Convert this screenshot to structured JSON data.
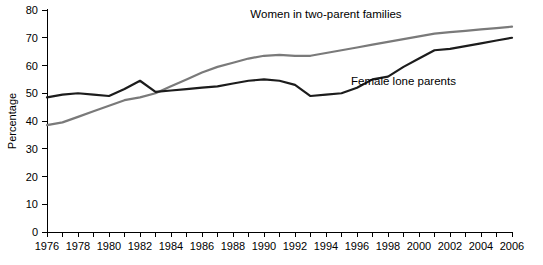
{
  "chart_data": {
    "type": "line",
    "title": "",
    "xlabel": "",
    "ylabel": "Percentage",
    "xlim": [
      1976,
      2006
    ],
    "ylim": [
      0,
      80
    ],
    "grid": false,
    "legend_position": "inline-annotation",
    "y_ticks": [
      0,
      10,
      20,
      30,
      40,
      50,
      60,
      70,
      80
    ],
    "y_tick_labels": [
      "0",
      "10",
      "20",
      "30",
      "40",
      "50",
      "60",
      "70",
      "80"
    ],
    "x_ticks": [
      1976,
      1977,
      1978,
      1979,
      1980,
      1981,
      1982,
      1983,
      1984,
      1985,
      1986,
      1987,
      1988,
      1989,
      1990,
      1991,
      1992,
      1993,
      1994,
      1995,
      1996,
      1997,
      1998,
      1999,
      2000,
      2001,
      2002,
      2003,
      2004,
      2005,
      2006
    ],
    "x_tick_labels_shown": [
      "1976",
      "1978",
      "1980",
      "1982",
      "1984",
      "1986",
      "1988",
      "1990",
      "1992",
      "1994",
      "1996",
      "1998",
      "2000",
      "2002",
      "2004",
      "2006"
    ],
    "x": [
      1976,
      1977,
      1978,
      1979,
      1980,
      1981,
      1982,
      1983,
      1984,
      1985,
      1986,
      1987,
      1988,
      1989,
      1990,
      1991,
      1992,
      1993,
      1994,
      1995,
      1996,
      1997,
      1998,
      1999,
      2000,
      2001,
      2002,
      2003,
      2004,
      2005,
      2006
    ],
    "series": [
      {
        "name": "Women in two-parent families",
        "color": "#7a7a7a",
        "label_x": 1994,
        "label_y": 77,
        "values": [
          38.5,
          39.5,
          41.5,
          43.5,
          45.5,
          47.5,
          48.5,
          50.0,
          52.5,
          55.0,
          57.5,
          59.5,
          61.0,
          62.5,
          63.5,
          63.8,
          63.5,
          63.5,
          64.5,
          65.5,
          66.5,
          67.5,
          68.5,
          69.5,
          70.5,
          71.5,
          72.0,
          72.5,
          73.0,
          73.5,
          74.0
        ]
      },
      {
        "name": "Female lone parents",
        "color": "#1c1c1c",
        "label_x": 1999,
        "label_y": 53,
        "values": [
          48.5,
          49.5,
          50.0,
          49.5,
          49.0,
          51.5,
          54.5,
          50.5,
          51.0,
          51.5,
          52.0,
          52.5,
          53.5,
          54.5,
          55.0,
          54.5,
          53.0,
          49.0,
          49.5,
          50.0,
          52.0,
          55.0,
          56.0,
          59.5,
          62.5,
          65.5,
          66.0,
          67.0,
          68.0,
          69.0,
          70.0
        ]
      }
    ]
  }
}
